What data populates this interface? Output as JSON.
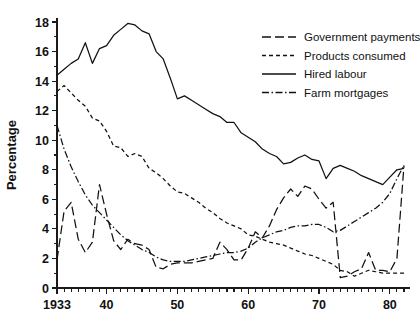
{
  "chart_data": {
    "type": "line",
    "title": "",
    "xlabel": "",
    "ylabel": "Percentage",
    "xlim": [
      1933,
      1982
    ],
    "ylim": [
      0,
      18
    ],
    "grid": false,
    "legend_position": "top-right",
    "y_ticks": [
      "0",
      "2",
      "4",
      "6",
      "8",
      "10",
      "12",
      "14",
      "16",
      "18"
    ],
    "y_tick_values": [
      0,
      2,
      4,
      6,
      8,
      10,
      12,
      14,
      16,
      18
    ],
    "x_ticks": [
      "1933",
      "40",
      "50",
      "60",
      "70",
      "80"
    ],
    "x_tick_values": [
      1933,
      1940,
      1950,
      1960,
      1970,
      1980
    ],
    "x_minor_step": 1,
    "x": [
      1933,
      1934,
      1935,
      1936,
      1937,
      1938,
      1939,
      1940,
      1941,
      1942,
      1943,
      1944,
      1945,
      1946,
      1947,
      1948,
      1949,
      1950,
      1951,
      1952,
      1953,
      1954,
      1955,
      1956,
      1957,
      1958,
      1959,
      1960,
      1961,
      1962,
      1963,
      1964,
      1965,
      1966,
      1967,
      1968,
      1969,
      1970,
      1971,
      1972,
      1973,
      1974,
      1975,
      1976,
      1977,
      1978,
      1979,
      1980,
      1981,
      1982
    ],
    "series": [
      {
        "name": "Government payments",
        "dash": "long-dash",
        "dash_array": "9,4",
        "color": "#111111",
        "values": [
          1.9,
          5.2,
          5.8,
          3.3,
          2.4,
          3.1,
          7.0,
          5.0,
          3.2,
          2.6,
          3.3,
          3.0,
          2.9,
          2.6,
          1.4,
          1.3,
          1.6,
          1.7,
          1.7,
          1.7,
          1.8,
          1.9,
          2.0,
          3.1,
          2.6,
          1.9,
          1.9,
          2.7,
          3.8,
          3.4,
          4.2,
          5.3,
          6.1,
          6.7,
          6.2,
          6.9,
          6.7,
          6.0,
          5.4,
          5.8,
          0.7,
          0.8,
          1.1,
          1.3,
          2.4,
          1.2,
          1.2,
          1.1,
          2.0,
          8.3
        ]
      },
      {
        "name": "Products consumed",
        "dash": "short-dash",
        "dash_array": "4,3",
        "color": "#111111",
        "values": [
          13.3,
          13.7,
          13.2,
          12.7,
          12.3,
          11.5,
          11.3,
          10.6,
          9.6,
          9.5,
          8.9,
          9.1,
          8.9,
          8.1,
          7.8,
          7.4,
          6.9,
          6.5,
          6.4,
          6.1,
          5.8,
          5.4,
          5.1,
          4.7,
          4.4,
          4.2,
          4.0,
          3.6,
          3.5,
          3.3,
          3.1,
          3.0,
          2.9,
          2.7,
          2.5,
          2.3,
          2.2,
          2.0,
          1.8,
          1.6,
          1.2,
          1.1,
          0.8,
          1.0,
          1.2,
          1.1,
          1.0,
          1.0,
          1.0,
          1.0
        ]
      },
      {
        "name": "Hired labour",
        "dash": "solid",
        "dash_array": "none",
        "color": "#111111",
        "values": [
          14.4,
          14.8,
          15.2,
          15.5,
          16.6,
          15.2,
          16.2,
          16.4,
          17.1,
          17.5,
          17.9,
          17.8,
          17.4,
          17.2,
          16.0,
          15.5,
          14.2,
          12.8,
          13.0,
          12.7,
          12.4,
          12.1,
          11.8,
          11.6,
          11.2,
          11.2,
          10.5,
          10.2,
          9.9,
          9.4,
          9.1,
          8.9,
          8.4,
          8.5,
          8.8,
          9.0,
          8.7,
          8.6,
          7.4,
          8.1,
          8.3,
          8.1,
          7.9,
          7.6,
          7.4,
          7.2,
          7.0,
          7.5,
          8.0,
          8.1
        ]
      },
      {
        "name": "Farm mortgages",
        "dash": "dash-dot",
        "dash_array": "7,2.5,1.5,2.5",
        "color": "#111111",
        "values": [
          11.0,
          9.4,
          8.2,
          7.2,
          6.3,
          5.6,
          5.1,
          4.6,
          4.1,
          3.6,
          3.2,
          2.9,
          2.6,
          2.4,
          2.1,
          1.9,
          1.8,
          1.8,
          1.8,
          1.9,
          2.0,
          2.1,
          2.2,
          2.3,
          2.4,
          2.4,
          2.5,
          2.7,
          3.1,
          3.4,
          3.6,
          3.8,
          3.9,
          4.1,
          4.2,
          4.2,
          4.3,
          4.3,
          4.1,
          3.8,
          3.9,
          4.2,
          4.5,
          4.8,
          5.1,
          5.4,
          5.8,
          6.4,
          7.4,
          8.3
        ]
      }
    ]
  },
  "legend": {
    "entries": [
      {
        "label": "Government payments"
      },
      {
        "label": "Products consumed"
      },
      {
        "label": "Hired labour"
      },
      {
        "label": "Farm mortgages"
      }
    ]
  }
}
